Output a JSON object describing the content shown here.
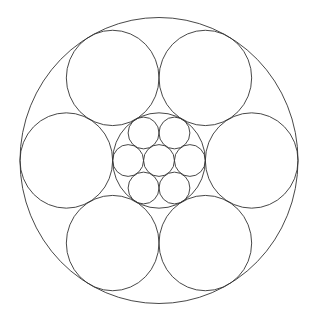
{
  "diagram": {
    "title": "",
    "stroke_color": "#333333",
    "stroke_width": 0.9,
    "background": "#ffffff",
    "outer": {
      "cx": 159,
      "cy": 160.5,
      "rx": 139,
      "ry": 143
    },
    "large_circles": {
      "count": 6,
      "radius_ratio": 0.3333,
      "distance_ratio": 0.6667,
      "start_angle_deg": 0
    },
    "inner_circle": {
      "radius_ratio": 0.3333
    },
    "small_circles": {
      "count": 7,
      "radius_ratio": 0.1111,
      "ring_count": 6,
      "ring_distance_ratio": 0.2222,
      "ring_start_angle_deg": 0
    }
  }
}
